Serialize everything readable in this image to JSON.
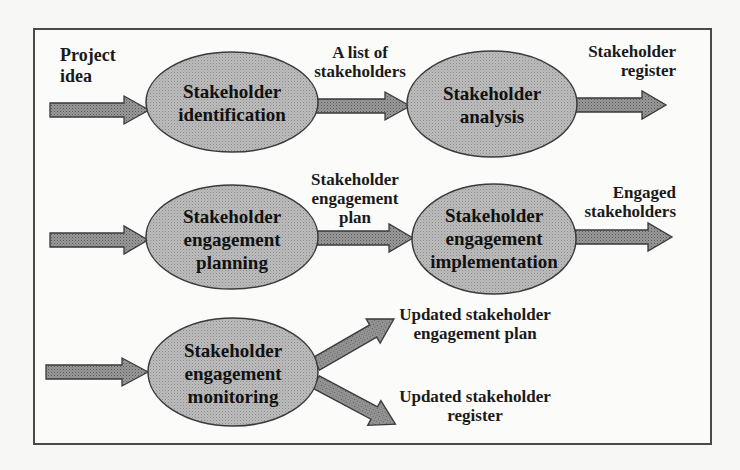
{
  "diagram": {
    "type": "stakeholder-management-process-flow",
    "colors": {
      "node_fill": "#b4b4b4",
      "node_stroke": "#3a3a3a",
      "arrow_fill": "#8c8c8c",
      "arrow_stroke": "#3a3a3a",
      "frame": "#4a4a4a",
      "text": "#1a1a1a"
    },
    "nodes": [
      {
        "id": "identification",
        "label": "Stakeholder\nidentification"
      },
      {
        "id": "analysis",
        "label": "Stakeholder\nanalysis"
      },
      {
        "id": "planning",
        "label": "Stakeholder\nengagement\nplanning"
      },
      {
        "id": "implementation",
        "label": "Stakeholder\nengagement\nimplementation"
      },
      {
        "id": "monitoring",
        "label": "Stakeholder\nengagement\nmonitoring"
      }
    ],
    "flow_labels": {
      "project_idea": "Project\nidea",
      "list_of_stakeholders": "A list of\nstakeholders",
      "stakeholder_register": "Stakeholder\nregister",
      "engagement_plan": "Stakeholder\nengagement\nplan",
      "engaged_stakeholders": "Engaged\nstakeholders",
      "updated_plan": "Updated stakeholder\nengagement plan",
      "updated_register": "Updated stakeholder\nregister"
    },
    "edges": [
      {
        "from": "input",
        "to": "identification",
        "label": "Project idea"
      },
      {
        "from": "identification",
        "to": "analysis",
        "label": "A list of stakeholders"
      },
      {
        "from": "analysis",
        "to": "output",
        "label": "Stakeholder register"
      },
      {
        "from": "input",
        "to": "planning",
        "label": ""
      },
      {
        "from": "planning",
        "to": "implementation",
        "label": "Stakeholder engagement plan"
      },
      {
        "from": "implementation",
        "to": "output",
        "label": "Engaged stakeholders"
      },
      {
        "from": "input",
        "to": "monitoring",
        "label": ""
      },
      {
        "from": "monitoring",
        "to": "output",
        "label": "Updated stakeholder engagement plan"
      },
      {
        "from": "monitoring",
        "to": "output",
        "label": "Updated stakeholder register"
      }
    ]
  }
}
